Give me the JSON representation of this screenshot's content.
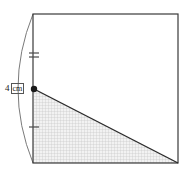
{
  "figure": {
    "kind": "geometry-diagram",
    "background_color": "#ffffff",
    "outline_color": "#3a3a3a",
    "shade_color": "#c9c9c9",
    "shade_fill": "#e8e8e8",
    "accent_color": "#1a1a1a"
  },
  "labels": {
    "length_4cm": {
      "value": "4",
      "unit": "cm",
      "full": "4 cm"
    }
  },
  "square": {
    "name": "outer-square",
    "top_left": [
      33,
      14
    ],
    "top_right": [
      178,
      14
    ],
    "bottom_right": [
      178,
      163
    ],
    "bottom_left": [
      33,
      163
    ],
    "side_px": 145
  },
  "triangle": {
    "name": "shaded-triangle",
    "apex": [
      34,
      89
    ],
    "bottom_left": [
      33,
      163
    ],
    "bottom_right": [
      178,
      163
    ],
    "shaded": true
  },
  "vertex_dot": {
    "name": "vertex-point",
    "position": [
      34,
      89
    ],
    "radius": 3.2,
    "color": "#1a1a1a"
  },
  "arc": {
    "name": "left-arc",
    "start": [
      33,
      14
    ],
    "end": [
      33,
      163
    ],
    "bulge_x": 12,
    "color": "#6a6a6a"
  },
  "tick_marks": {
    "upper": {
      "name": "double-tick",
      "count": 2,
      "center_y": 55,
      "x": 34,
      "half_width": 5,
      "spacing": 4
    },
    "lower": {
      "name": "single-tick",
      "count": 1,
      "center_y": 127,
      "x": 34,
      "half_width": 5,
      "spacing": 0
    }
  }
}
